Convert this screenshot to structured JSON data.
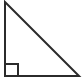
{
  "figure": {
    "name": "right-triangle",
    "canvas": {
      "width": 82,
      "height": 84,
      "background_color": "#ffffff"
    },
    "style": {
      "stroke_color": "#2b2b2b",
      "stroke_width": 2,
      "fill": "none",
      "marker_stroke_color": "#2b2b2b",
      "marker_stroke_width": 2,
      "marker_fill": "none"
    },
    "vertices": [
      {
        "label": "apex",
        "x": 5,
        "y": 2
      },
      {
        "label": "right-angle",
        "x": 5,
        "y": 76
      },
      {
        "label": "base-end",
        "x": 79,
        "y": 76
      }
    ],
    "edges": [
      {
        "label": "vertical-leg",
        "from": "apex",
        "to": "right-angle"
      },
      {
        "label": "horizontal-leg",
        "from": "right-angle",
        "to": "base-end"
      },
      {
        "label": "hypotenuse",
        "from": "apex",
        "to": "base-end"
      }
    ],
    "triangle_path": "M 5 2 L 5 76 L 79 76 Z",
    "right_angle_marker": {
      "path": "M 5 64 L 18 64 L 18 76",
      "x": 5,
      "y": 64,
      "size": 13
    }
  }
}
